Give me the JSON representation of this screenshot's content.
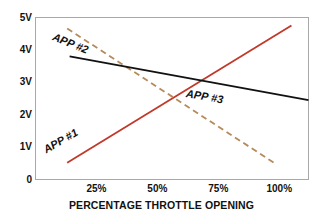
{
  "chart_data": {
    "type": "line",
    "title": "",
    "xlabel": "PERCENTAGE THROTTLE OPENING",
    "ylabel": "",
    "xlim": [
      0,
      112
    ],
    "ylim": [
      0,
      5
    ],
    "grid": false,
    "legend_position": "inline-labels",
    "x_ticks": [
      {
        "value": 25,
        "label": "25%"
      },
      {
        "value": 50,
        "label": "50%"
      },
      {
        "value": 75,
        "label": "75%"
      },
      {
        "value": 100,
        "label": "100%"
      }
    ],
    "y_ticks": [
      {
        "value": 5,
        "label": "5V"
      },
      {
        "value": 4,
        "label": "4V"
      },
      {
        "value": 3,
        "label": "3V"
      },
      {
        "value": 2,
        "label": "2V"
      },
      {
        "value": 1,
        "label": "1V"
      },
      {
        "value": 0,
        "label": "0"
      }
    ],
    "series": [
      {
        "name": "APP #1",
        "label": "APP #1",
        "color": "#c0392b",
        "style": "solid",
        "width": 1.8,
        "x": [
          13,
          105
        ],
        "values": [
          0.52,
          4.75
        ],
        "label_x": 63,
        "label_y": 150,
        "label_angle": -30
      },
      {
        "name": "APP #2",
        "label": "APP #2",
        "color": "#b58b5a",
        "style": "dashed",
        "width": 1.8,
        "x": [
          13,
          99
        ],
        "values": [
          4.66,
          0.46
        ],
        "label_x": 72,
        "label_y": 36,
        "label_angle": 22
      },
      {
        "name": "APP #3",
        "label": "APP #3",
        "color": "#111111",
        "style": "solid",
        "width": 2.0,
        "x": [
          14,
          112
        ],
        "values": [
          3.8,
          2.45
        ],
        "label_x": 205,
        "label_y": 93,
        "label_angle": 10
      }
    ],
    "frame_color": "#a8a8a8",
    "background_color": "#ffffff"
  }
}
